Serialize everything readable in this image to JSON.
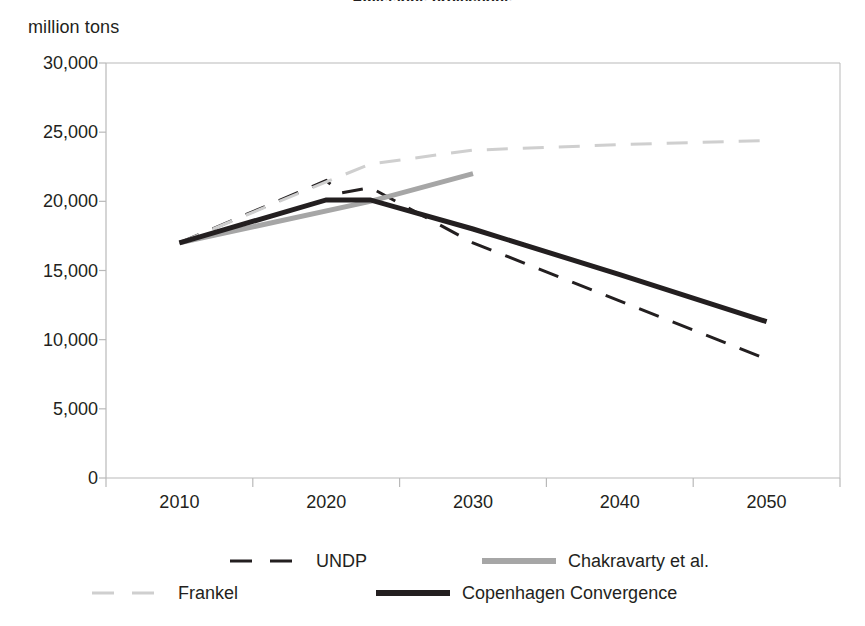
{
  "chart_data": {
    "type": "line",
    "title": "Emissions projections",
    "ylabel": "million tons",
    "xlabel": "",
    "ylim": [
      0,
      30000
    ],
    "xlim": [
      2005,
      2055
    ],
    "grid": false,
    "legend_position": "bottom",
    "ytick_labels": [
      "30,000",
      "25,000",
      "20,000",
      "15,000",
      "10,000",
      "5,000",
      "0"
    ],
    "ytick_values": [
      30000,
      25000,
      20000,
      15000,
      10000,
      5000,
      0
    ],
    "xtick_labels": [
      "2010",
      "2020",
      "2030",
      "2040",
      "2050"
    ],
    "xtick_values": [
      2010,
      2020,
      2030,
      2040,
      2050
    ],
    "series": [
      {
        "name": "UNDP",
        "style": "dashed",
        "color": "#231f20",
        "width": 3,
        "x": [
          2010,
          2020,
          2021,
          2023,
          2030,
          2050
        ],
        "values": [
          17000,
          21500,
          20600,
          21000,
          17000,
          8600
        ]
      },
      {
        "name": "Chakravarty et al.",
        "style": "solid",
        "color": "#a6a6a6",
        "width": 5,
        "x": [
          2010,
          2023,
          2030
        ],
        "values": [
          17000,
          20000,
          22000
        ]
      },
      {
        "name": "Frankel",
        "style": "dashed",
        "color": "#cfcfcf",
        "width": 3,
        "x": [
          2010,
          2020,
          2023,
          2030,
          2040,
          2050
        ],
        "values": [
          17000,
          21400,
          22700,
          23700,
          24100,
          24400
        ]
      },
      {
        "name": "Copenhagen Convergence",
        "style": "solid",
        "color": "#231f20",
        "width": 5,
        "x": [
          2010,
          2020,
          2023,
          2030,
          2040,
          2050
        ],
        "values": [
          17000,
          20100,
          20100,
          18000,
          14700,
          11300
        ]
      }
    ]
  },
  "legend": {
    "items": [
      {
        "label": "UNDP",
        "swatch": "dashed-dark"
      },
      {
        "label": "Chakravarty et al.",
        "swatch": "solid-gray"
      },
      {
        "label": "Frankel",
        "swatch": "dashed-light"
      },
      {
        "label": "Copenhagen Convergence",
        "swatch": "solid-dark"
      }
    ]
  },
  "colors": {
    "axis": "#b9b9b9",
    "text": "#231f20",
    "dark_line": "#231f20",
    "gray_line": "#a6a6a6",
    "light_line": "#cfcfcf",
    "background": "#ffffff"
  }
}
